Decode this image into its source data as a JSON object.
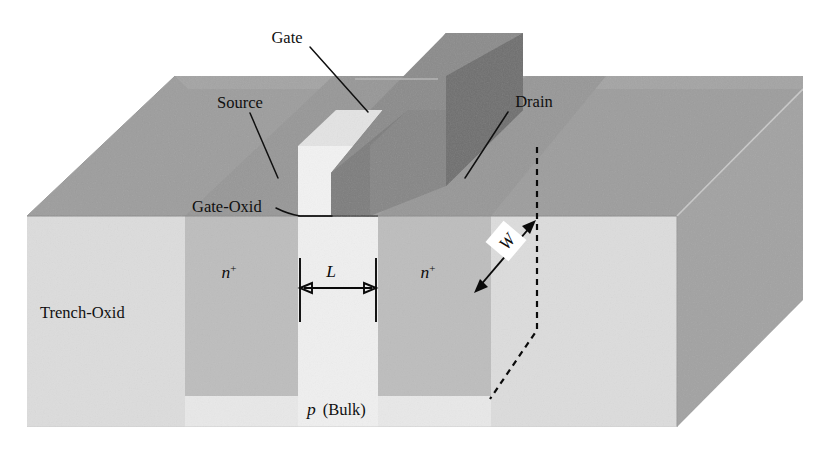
{
  "figure": {
    "type": "technical-diagram",
    "background_color": "#ffffff",
    "width": 830,
    "height": 464
  },
  "labels": {
    "gate": "Gate",
    "source": "Source",
    "drain": "Drain",
    "gate_oxide": "Gate-Oxid",
    "trench_oxide": "Trench-Oxid",
    "n_plus_left": "n",
    "n_plus_left_sup": "+",
    "n_plus_right": "n",
    "n_plus_right_sup": "+",
    "bulk_symbol": "p",
    "bulk_text": "(Bulk)",
    "length_dim": "L",
    "width_dim": "W"
  },
  "colors": {
    "background": "#ffffff",
    "top_face_oxide": "#9d9d9d",
    "top_face_silicon": "#a8a8a8",
    "right_face": "#a2a2a2",
    "front_face_trench": "#dcdcdc",
    "front_face_nplus": "#bdbdbd",
    "front_face_channel": "#efefef",
    "front_face_bulk": "#e8e8e8",
    "gate_top": "#8f8f8f",
    "gate_side": "#777777",
    "gate_front": "#858585",
    "gate_oxide_column": "#f2f2f2",
    "outline": "#8a8a8a",
    "ink": "#101010"
  },
  "geometry_notes": {
    "projection": "oblique-3d",
    "depth_dx": 148,
    "depth_dy": -140,
    "surface_y": 216,
    "block_bottom_y": 427
  }
}
